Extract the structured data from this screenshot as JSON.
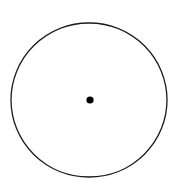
{
  "diagram": {
    "type": "circle-with-center-point",
    "canvas": {
      "width": 182,
      "height": 186,
      "background": "#ffffff"
    },
    "circle": {
      "cx": 89,
      "cy": 100,
      "rx": 78,
      "ry": 77,
      "stroke": "#1a1a1a",
      "stroke_width": 1.3,
      "fill": "none"
    },
    "center_point": {
      "cx": 90,
      "cy": 100,
      "r": 3.6,
      "fill": "#000000"
    }
  }
}
